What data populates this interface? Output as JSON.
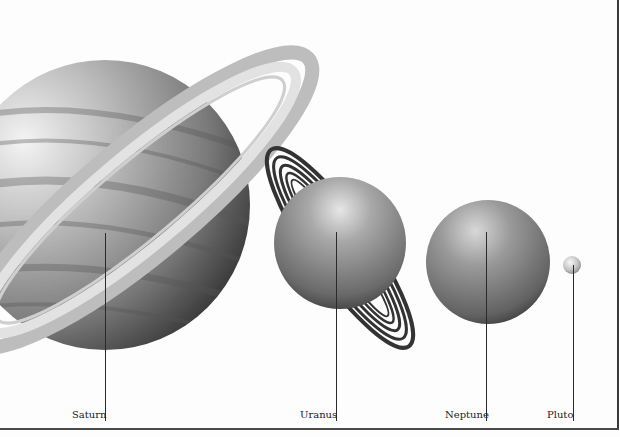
{
  "figure": {
    "planets": [
      {
        "name": "Saturn",
        "label": "Saturn",
        "shade": "#9a9a9a"
      },
      {
        "name": "Uranus",
        "label": "Uranus",
        "shade": "#8a8a8a"
      },
      {
        "name": "Neptune",
        "label": "Neptune",
        "shade": "#8c8c8c"
      },
      {
        "name": "Pluto",
        "label": "Pluto",
        "shade": "#c8c8c8"
      }
    ]
  }
}
